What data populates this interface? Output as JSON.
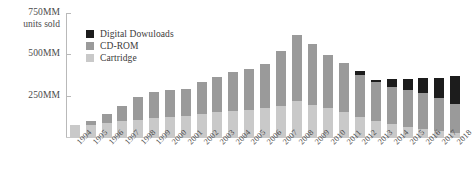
{
  "chart_data": {
    "type": "bar",
    "stacked": true,
    "title": "",
    "subtitle": "",
    "xlabel": "",
    "ylabel": "750MM units sold",
    "ylim": [
      0,
      750
    ],
    "grid": false,
    "legend_position": "top-left",
    "y_ticks": [
      {
        "value": 750,
        "label": "750MM"
      },
      {
        "value": 500,
        "label": "500MM"
      },
      {
        "value": 250,
        "label": "250MM"
      }
    ],
    "y_axis_caption": "units sold",
    "categories": [
      "1994",
      "1995",
      "1996",
      "1997",
      "1998",
      "1999",
      "2000",
      "2001",
      "2002",
      "2003",
      "2004",
      "2005",
      "2006",
      "2007",
      "2008",
      "2009",
      "2010",
      "2011",
      "2012",
      "2013",
      "2014",
      "2015",
      "2016",
      "2017",
      "2018"
    ],
    "series": [
      {
        "name": "Cartridge",
        "color": "#c9c9c9",
        "values": [
          70,
          75,
          85,
          95,
          105,
          115,
          120,
          125,
          140,
          150,
          160,
          165,
          175,
          190,
          215,
          195,
          175,
          150,
          120,
          95,
          80,
          62,
          50,
          38,
          22
        ]
      },
      {
        "name": "CD-ROM",
        "color": "#9a9a9a",
        "values": [
          0,
          22,
          55,
          95,
          140,
          155,
          165,
          168,
          195,
          215,
          235,
          245,
          265,
          330,
          400,
          370,
          320,
          300,
          255,
          240,
          225,
          225,
          215,
          200,
          175
        ]
      },
      {
        "name": "Digital Dowuloads",
        "color": "#1c1c1c",
        "values": [
          0,
          0,
          0,
          0,
          0,
          0,
          0,
          0,
          0,
          0,
          0,
          0,
          0,
          0,
          0,
          0,
          0,
          0,
          22,
          12,
          48,
          63,
          95,
          120,
          175
        ]
      }
    ],
    "totals": [
      70,
      97,
      140,
      190,
      245,
      270,
      285,
      293,
      335,
      365,
      395,
      410,
      440,
      520,
      615,
      565,
      495,
      450,
      397,
      347,
      353,
      350,
      360,
      358,
      372
    ]
  },
  "legend": {
    "items": [
      {
        "label": "Digital Dowuloads",
        "color": "#1c1c1c"
      },
      {
        "label": "CD-ROM",
        "color": "#9a9a9a"
      },
      {
        "label": "Cartridge",
        "color": "#c9c9c9"
      }
    ]
  },
  "colors": {
    "digital": "#1c1c1c",
    "cdrom": "#9a9a9a",
    "cartridge": "#c9c9c9",
    "axis": "#b9b9b9",
    "text": "#3a3a3a"
  }
}
